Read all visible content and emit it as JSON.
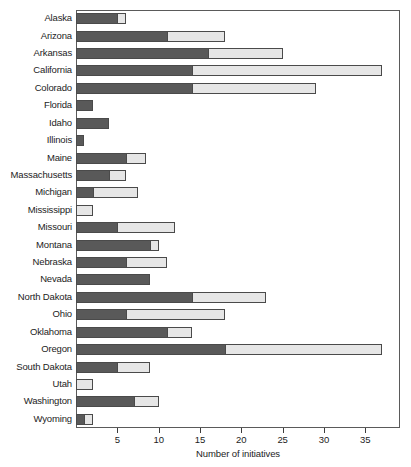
{
  "chart_data": {
    "type": "bar",
    "orientation": "horizontal",
    "stacked": true,
    "title": "",
    "xlabel": "Number of initiatives",
    "ylabel": "",
    "xlim": [
      0,
      39.2
    ],
    "xticks": [
      5,
      10,
      15,
      20,
      25,
      30,
      35
    ],
    "xtick_labels": [
      "5",
      "10",
      "15",
      "20",
      "25",
      "30",
      "35"
    ],
    "grid": false,
    "legend": "none",
    "categories": [
      "Alaska",
      "Arizona",
      "Arkansas",
      "California",
      "Colorado",
      "Florida",
      "Idaho",
      "Illinois",
      "Maine",
      "Massachusetts",
      "Michigan",
      "Mississippi",
      "Missouri",
      "Montana",
      "Nebraska",
      "Nevada",
      "North Dakota",
      "Ohio",
      "Oklahoma",
      "Oregon",
      "South Dakota",
      "Utah",
      "Washington",
      "Wyoming"
    ],
    "series": [
      {
        "name": "dark-segment",
        "color": "#595959",
        "values": [
          5,
          11,
          16,
          14,
          14,
          2,
          4,
          1,
          6,
          4,
          2,
          0,
          5,
          9,
          6,
          9,
          14,
          6,
          11,
          18,
          5,
          0,
          7,
          1
        ]
      },
      {
        "name": "light-segment",
        "color": "#e6e6e6",
        "values": [
          1,
          7,
          9,
          23,
          15,
          0,
          0,
          0,
          2.5,
          2,
          5.5,
          2,
          7,
          1,
          5,
          0,
          9,
          12,
          3,
          19,
          4,
          2,
          3,
          1
        ]
      }
    ],
    "totals": [
      6,
      18,
      25,
      37,
      29,
      2,
      4,
      1,
      8.5,
      6,
      7.5,
      2,
      12,
      10,
      11,
      9,
      23,
      18,
      14,
      37,
      9,
      2,
      10,
      2
    ]
  },
  "style": {
    "frame_color": "#5a5a5a",
    "bar_outline": "#4a4a4a",
    "dark_fill": "#595959",
    "light_fill": "#e6e6e6",
    "text_color": "#1c1c1c",
    "background": "#ffffff"
  }
}
